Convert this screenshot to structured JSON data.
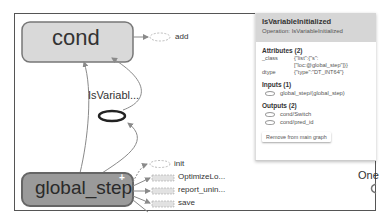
{
  "graph": {
    "nodes": {
      "cond": {
        "label": "cond"
      },
      "add": {
        "label": "add"
      },
      "is_variable": {
        "label": "IsVariabl..."
      },
      "global_step": {
        "label": "global_step",
        "expand_marker": "+"
      },
      "init": {
        "label": "init"
      },
      "optimize": {
        "label": "OptimizeLo..."
      },
      "report": {
        "label": "report_unin..."
      },
      "save": {
        "label": "save"
      },
      "one": {
        "label": "One"
      }
    },
    "faint_text": "tet"
  },
  "info_panel": {
    "title": "IsVariableInitialized",
    "operation": "Operation: IsVariableInitialized",
    "attributes_header": "Attributes (2)",
    "attributes": [
      {
        "key": "_class",
        "value_line1": "{\"list\":{\"s\":",
        "value_line2": "[\"loc:@global_step\"]}}"
      },
      {
        "key": "dtype",
        "value_line1": "{\"type\":\"DT_INT64\"}"
      }
    ],
    "inputs_header": "Inputs (1)",
    "inputs": [
      "global_step/(global_step)"
    ],
    "outputs_header": "Outputs (2)",
    "outputs": [
      "cond/Switch",
      "cond/pred_id"
    ],
    "remove_button": "Remove from main graph"
  },
  "colors": {
    "cond_fill": "#d9d9d9",
    "global_step_fill": "#9a9a9a",
    "edge": "#8a8a8a",
    "panel_header": "#d6d6d6"
  }
}
